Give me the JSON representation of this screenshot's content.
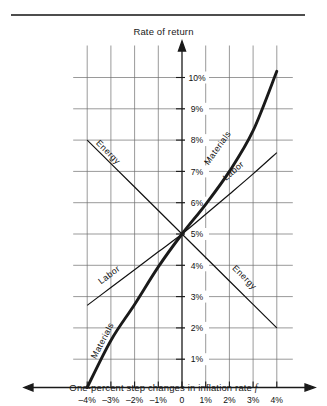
{
  "figure": {
    "y_axis_title": "Rate of return",
    "x_axis_caption_prefix": "One-percent step changes in inflation rate ",
    "x_axis_caption_symbol": "f"
  },
  "chart_data": {
    "type": "line",
    "title": "",
    "xlabel": "One-percent step changes in inflation rate f",
    "ylabel": "Rate of return",
    "xlim": [
      -4,
      4
    ],
    "ylim": [
      0,
      10.6
    ],
    "grid": true,
    "legend": "inline-curve-labels",
    "x_tick_labels": [
      "–4%",
      "–3%",
      "–2%",
      "–1%",
      "0",
      "1%",
      "2%",
      "3%",
      "4%"
    ],
    "x_tick_values": [
      -4,
      -3,
      -2,
      -1,
      0,
      1,
      2,
      3,
      4
    ],
    "y_tick_labels": [
      "1%",
      "2%",
      "3%",
      "4%",
      "5%",
      "6%",
      "7%",
      "8%",
      "9%",
      "10%"
    ],
    "y_tick_values": [
      1,
      2,
      3,
      4,
      5,
      6,
      7,
      8,
      9,
      10
    ],
    "x": [
      -4,
      -3,
      -2,
      -1,
      0,
      1,
      2,
      3,
      4
    ],
    "series": [
      {
        "name": "Energy",
        "style": "thin",
        "values": [
          8.0,
          7.25,
          6.5,
          5.75,
          5.0,
          4.25,
          3.5,
          2.75,
          2.0
        ],
        "label_positions": [
          {
            "x": -3.2,
            "y": 7.55
          },
          {
            "x": 2.55,
            "y": 3.55
          }
        ]
      },
      {
        "name": "Labor",
        "style": "thin",
        "values": [
          2.72,
          3.29,
          3.86,
          4.43,
          5.0,
          5.63,
          6.27,
          6.92,
          7.6
        ],
        "label_positions": [
          {
            "x": -3.0,
            "y": 3.62
          },
          {
            "x": 2.25,
            "y": 6.95
          }
        ]
      },
      {
        "name": "Materials",
        "style": "bold",
        "values": [
          0.1,
          1.6,
          2.75,
          3.95,
          5.0,
          5.95,
          7.0,
          8.3,
          10.2
        ],
        "label_positions": [
          {
            "x": -3.25,
            "y": 1.55
          },
          {
            "x": 1.6,
            "y": 7.7
          }
        ]
      }
    ]
  }
}
